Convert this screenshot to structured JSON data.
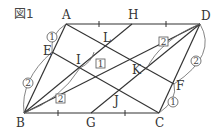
{
  "figure": {
    "title": "図1",
    "points": {
      "A": "A",
      "H": "H",
      "D": "D",
      "E": "E",
      "L": "L",
      "I": "I",
      "K": "K",
      "F": "F",
      "J": "J",
      "B": "B",
      "G": "G",
      "C": "C"
    },
    "ratios": {
      "ae": "1",
      "eb": "2",
      "il_box": "1",
      "bi_box": "2",
      "kd_box": "2",
      "df": "2",
      "fc": "1"
    },
    "colors": {
      "line": "#333333",
      "text": "#333333",
      "background": "#ffffff"
    }
  }
}
